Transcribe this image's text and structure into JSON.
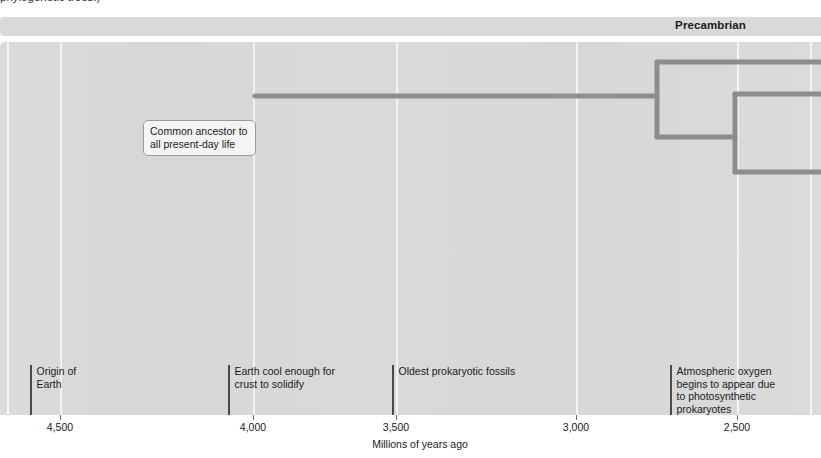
{
  "caption": {
    "text": "phylogenetic trees.)"
  },
  "era_banner": {
    "label": "Precambrian"
  },
  "callout": {
    "line1": "Common ancestor to",
    "line2": "all present-day life"
  },
  "events": [
    {
      "id": "origin-of-earth",
      "label": "Origin of\nEarth",
      "x": 30,
      "top": 365,
      "height": 51
    },
    {
      "id": "crust-solidify",
      "label": "Earth cool enough for\ncrust to solidify",
      "x": 228,
      "top": 365,
      "height": 51
    },
    {
      "id": "oldest-prokaryotic",
      "label": "Oldest prokaryotic fossils",
      "x": 392,
      "top": 365,
      "height": 51
    },
    {
      "id": "atmospheric-oxygen",
      "label": "Atmospheric oxygen\nbegins to appear due\nto photosynthetic\nprokaryotes",
      "x": 670,
      "top": 365,
      "height": 51
    }
  ],
  "axis": {
    "title": "Millions of years ago",
    "title_x": 420,
    "ticks": [
      {
        "label": "4,500",
        "x": 60
      },
      {
        "label": "4,000",
        "x": 253
      },
      {
        "label": "3,500",
        "x": 396
      },
      {
        "label": "3,000",
        "x": 576
      },
      {
        "label": "2,500",
        "x": 737
      }
    ]
  },
  "gridlines": [
    7,
    60,
    253,
    396,
    576,
    737,
    810
  ],
  "tree": {
    "stroke_color": "#8d8d8d",
    "stroke_width": 5,
    "trunk": {
      "x1": 255,
      "x2": 657,
      "y": 54
    },
    "nodes": [
      {
        "id": "node-1",
        "x": 657,
        "y_top": 20,
        "y_bottom": 95
      },
      {
        "id": "node-2",
        "x": 735,
        "y_top": 52,
        "y_bottom": 130
      }
    ],
    "tips": [
      {
        "id": "tip-upper",
        "x1": 657,
        "x2": 821,
        "y": 20
      },
      {
        "id": "tip-middle",
        "x1": 735,
        "x2": 821,
        "y": 52
      },
      {
        "id": "tip-lower",
        "x1": 735,
        "x2": 821,
        "y": 130
      },
      {
        "id": "tip-branch",
        "x1": 657,
        "x2": 735,
        "y": 95
      }
    ]
  },
  "colors": {
    "panel_bg": "#d7d7d7",
    "banner_bg": "#d9d9d9",
    "gridline": "#f2f2f2",
    "tree_stroke": "#8d8d8d",
    "event_tick": "#4a4a4a",
    "text": "#1a1a1a"
  },
  "chart_data": {
    "type": "line",
    "xlabel": "Millions of years ago",
    "ylabel": "",
    "xlim": [
      4700,
      2350
    ],
    "grid": true,
    "legend": "none",
    "x_ticks": [
      4500,
      4000,
      3500,
      3000,
      2500
    ],
    "annotations": [
      {
        "label": "Origin of Earth",
        "x": 4580
      },
      {
        "label": "Earth cool enough for crust to solidify",
        "x": 4065
      },
      {
        "label": "Oldest prokaryotic fossils",
        "x": 3510
      },
      {
        "label": "Atmospheric oxygen begins to appear due to photosynthetic prokaryotes",
        "x": 2820
      },
      {
        "label": "Common ancestor to all present-day life",
        "x": 4005
      }
    ],
    "series": [
      {
        "name": "Lineage trunk (common ancestor)",
        "x_start": 4005,
        "x_end": 2885
      },
      {
        "name": "Branch node 1",
        "x": 2885
      },
      {
        "name": "Branch node 2",
        "x": 2670
      }
    ]
  }
}
